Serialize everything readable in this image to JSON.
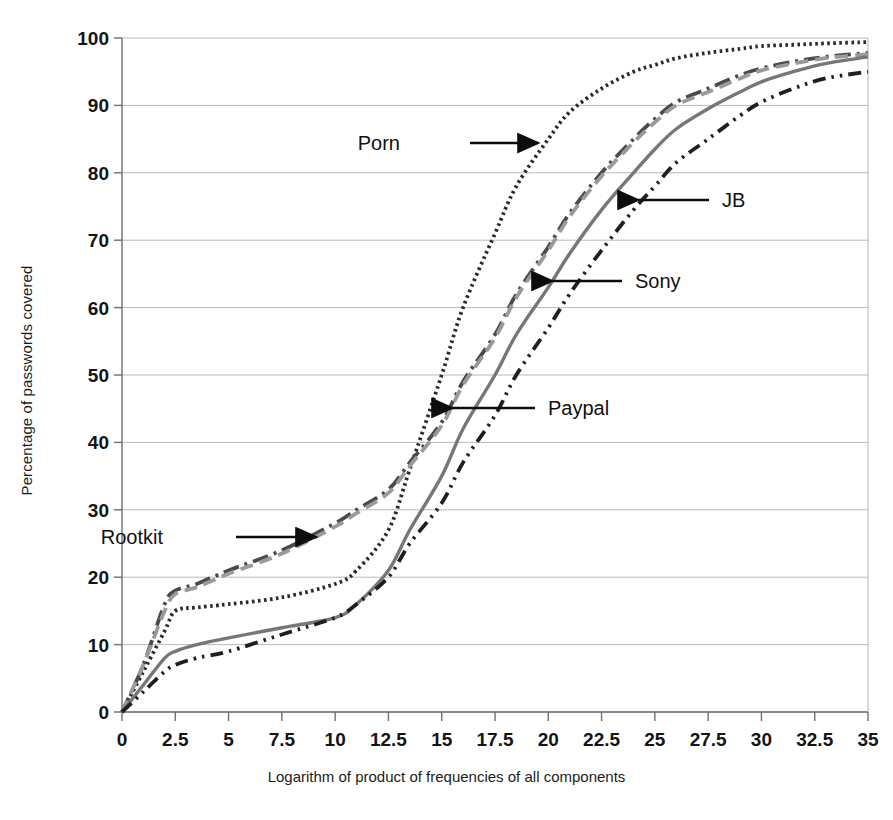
{
  "chart_data": {
    "type": "line",
    "title": "",
    "xlabel": "Logarithm of product of frequencies of all components",
    "ylabel": "Percentage of passwords covered",
    "xlim": [
      0,
      35
    ],
    "ylim": [
      0,
      100
    ],
    "grid": true,
    "legend_position": "inline-annotations",
    "xticks": [
      "0",
      "2.5",
      "5",
      "7.5",
      "10",
      "12.5",
      "15",
      "17.5",
      "20",
      "22.5",
      "25",
      "27.5",
      "30",
      "32.5",
      "35"
    ],
    "xtick_values": [
      0,
      2.5,
      5,
      7.5,
      10,
      12.5,
      15,
      17.5,
      20,
      22.5,
      25,
      27.5,
      30,
      32.5,
      35
    ],
    "yticks": [
      "0",
      "10",
      "20",
      "30",
      "40",
      "50",
      "60",
      "70",
      "80",
      "90",
      "100"
    ],
    "ytick_values": [
      0,
      10,
      20,
      30,
      40,
      50,
      60,
      70,
      80,
      90,
      100
    ],
    "x": [
      0,
      1,
      2,
      2.5,
      3.5,
      5,
      7.5,
      10,
      11,
      12.5,
      13.5,
      15,
      16,
      17.5,
      18.5,
      20,
      21,
      22.5,
      24,
      25,
      26,
      27.5,
      29,
      30,
      31.5,
      33,
      35
    ],
    "series": [
      {
        "name": "Porn",
        "style": "dotted",
        "color": "#2b2b2b",
        "values": [
          0,
          6,
          12,
          15,
          15.5,
          16,
          17,
          19,
          21,
          27,
          36,
          50,
          60,
          71,
          78,
          85,
          89,
          92.5,
          95,
          96,
          97,
          97.8,
          98.4,
          98.8,
          99,
          99.2,
          99.4
        ]
      },
      {
        "name": "Rootkit",
        "style": "dash-dot",
        "color": "#4a4a4a",
        "values": [
          0,
          7,
          16,
          18,
          19,
          21,
          24,
          28,
          30,
          33,
          37,
          43,
          49,
          56,
          62,
          69,
          74,
          80,
          85,
          88,
          90.5,
          92.5,
          94.5,
          95.5,
          96.5,
          97.2,
          97.8
        ]
      },
      {
        "name": "Paypal",
        "style": "dashed",
        "color": "#9a9a9a",
        "values": [
          0,
          7,
          15,
          17.5,
          18.5,
          20.5,
          23.5,
          27.5,
          29.5,
          32.5,
          36.5,
          42.5,
          48.5,
          55.5,
          61.5,
          68.5,
          73.5,
          79.5,
          84.5,
          87.5,
          90,
          92,
          94,
          95.2,
          96.2,
          97,
          97.6
        ]
      },
      {
        "name": "Sony",
        "style": "solid",
        "color": "#777777",
        "values": [
          0,
          4,
          8,
          9,
          10,
          11,
          12.5,
          14,
          16,
          21,
          27,
          35,
          42,
          50,
          56,
          63,
          68,
          74.5,
          80,
          83.5,
          86.5,
          89.5,
          92,
          93.5,
          95,
          96.2,
          97.2
        ]
      },
      {
        "name": "JB",
        "style": "dash-dot-dot",
        "color": "#1f1f1f",
        "values": [
          0,
          3,
          6,
          7,
          8,
          9,
          11.5,
          14,
          16,
          20,
          25,
          31,
          37,
          44,
          50,
          57,
          62,
          68.5,
          74.5,
          78,
          81.5,
          85,
          88.5,
          90.5,
          92.5,
          94,
          95
        ]
      }
    ],
    "annotations": [
      {
        "label": "Porn",
        "text_x": 400,
        "text_y": 143,
        "arrow_from_x": 470,
        "arrow_from_y": 143,
        "arrow_to_x": 538,
        "arrow_to_y": 143,
        "direction": "right"
      },
      {
        "label": "Rootkit",
        "text_x": 163,
        "text_y": 537,
        "arrow_from_x": 236,
        "arrow_from_y": 537,
        "arrow_to_x": 316,
        "arrow_to_y": 537,
        "direction": "right"
      },
      {
        "label": "Paypal",
        "text_x": 548,
        "text_y": 408,
        "arrow_from_x": 535,
        "arrow_from_y": 408,
        "arrow_to_x": 452,
        "arrow_to_y": 408,
        "direction": "left"
      },
      {
        "label": "Sony",
        "text_x": 635,
        "text_y": 281,
        "arrow_from_x": 622,
        "arrow_from_y": 281,
        "arrow_to_x": 552,
        "arrow_to_y": 281,
        "direction": "left"
      },
      {
        "label": "JB",
        "text_x": 722,
        "text_y": 200,
        "arrow_from_x": 709,
        "arrow_from_y": 200,
        "arrow_to_x": 638,
        "arrow_to_y": 200,
        "direction": "left"
      }
    ]
  },
  "colors": {
    "grid": "#b9b9b9",
    "axis": "#6e6e6e",
    "text": "#141414",
    "background": "#ffffff"
  }
}
